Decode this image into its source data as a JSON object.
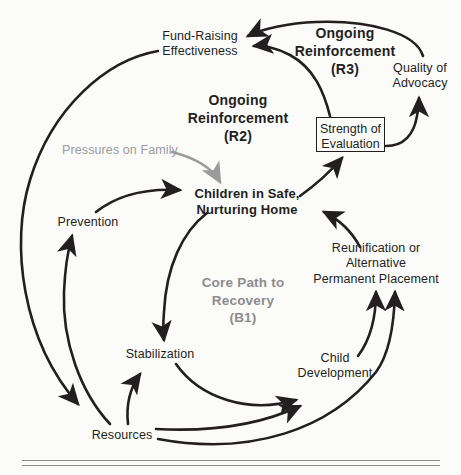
{
  "diagram": {
    "type": "causal-loop-diagram",
    "nodes": [
      {
        "id": "fund-raising-effectiveness",
        "label": "Fund-Raising\nEffectiveness",
        "style": "plain",
        "x": 200,
        "y": 44
      },
      {
        "id": "quality-of-advocacy",
        "label": "Quality of\nAdvocacy",
        "style": "plain",
        "x": 420,
        "y": 76
      },
      {
        "id": "strength-of-evaluation",
        "label": "Strength of\nEvaluation",
        "style": "boxed",
        "x": 350,
        "y": 134
      },
      {
        "id": "pressures-on-family",
        "label": "Pressures on Family",
        "style": "gray",
        "x": 120,
        "y": 150
      },
      {
        "id": "children-in-safe-nurturing-home",
        "label": "Children in Safe,\nNurturing Home",
        "style": "bold",
        "x": 247,
        "y": 200
      },
      {
        "id": "prevention",
        "label": "Prevention",
        "style": "plain",
        "x": 88,
        "y": 222
      },
      {
        "id": "reunification-or-alternative-permanent-placement",
        "label": "Reunification or\nAlternative\nPermanent Placement",
        "style": "plain",
        "x": 376,
        "y": 263
      },
      {
        "id": "stabilization",
        "label": "Stabilization",
        "style": "plain",
        "x": 160,
        "y": 354
      },
      {
        "id": "child-development",
        "label": "Child\nDevelopment",
        "style": "plain",
        "x": 335,
        "y": 366
      },
      {
        "id": "resources",
        "label": "Resources",
        "style": "plain",
        "x": 122,
        "y": 435
      }
    ],
    "loop_labels": [
      {
        "id": "r3",
        "label": "Ongoing\nReinforcement\n(R3)",
        "tone": "dark",
        "x": 345,
        "y": 51
      },
      {
        "id": "r2",
        "label": "Ongoing\nReinforcement\n(R2)",
        "tone": "dark",
        "x": 238,
        "y": 118
      },
      {
        "id": "b1",
        "label": "Core Path to\nRecovery\n(B1)",
        "tone": "muted",
        "x": 243,
        "y": 300
      }
    ],
    "links": [
      {
        "from": "quality-of-advocacy",
        "to": "fund-raising-effectiveness"
      },
      {
        "from": "strength-of-evaluation",
        "to": "fund-raising-effectiveness"
      },
      {
        "from": "strength-of-evaluation",
        "to": "quality-of-advocacy"
      },
      {
        "from": "children-in-safe-nurturing-home",
        "to": "strength-of-evaluation"
      },
      {
        "from": "pressures-on-family",
        "to": "children-in-safe-nurturing-home",
        "tone": "gray"
      },
      {
        "from": "prevention",
        "to": "children-in-safe-nurturing-home"
      },
      {
        "from": "reunification-or-alternative-permanent-placement",
        "to": "children-in-safe-nurturing-home"
      },
      {
        "from": "fund-raising-effectiveness",
        "to": "resources"
      },
      {
        "from": "resources",
        "to": "prevention"
      },
      {
        "from": "resources",
        "to": "stabilization"
      },
      {
        "from": "children-in-safe-nurturing-home",
        "to": "stabilization"
      },
      {
        "from": "stabilization",
        "to": "child-development"
      },
      {
        "from": "resources",
        "to": "child-development"
      },
      {
        "from": "child-development",
        "to": "reunification-or-alternative-permanent-placement"
      },
      {
        "from": "resources",
        "to": "reunification-or-alternative-permanent-placement"
      }
    ],
    "colors": {
      "ink": "#231f20",
      "gray": "#9c9b9c",
      "muted_label": "#8d8c8d",
      "rule": "#8e8d8e",
      "background": "#fbfbfa"
    }
  }
}
